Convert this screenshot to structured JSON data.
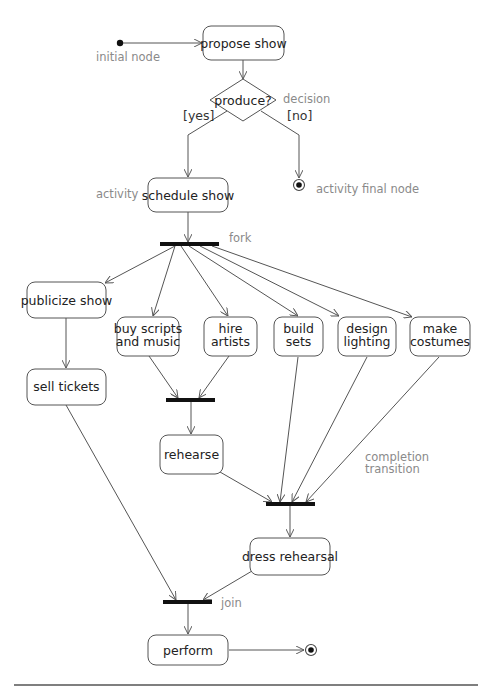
{
  "diagram": {
    "type": "UML activity diagram",
    "colors": {
      "node_stroke": "#555555",
      "bar": "#111111",
      "annotation": "#8a8a8a",
      "text": "#222222"
    },
    "nodes": {
      "propose_show": "propose show",
      "decision": "produce?",
      "schedule_show": "schedule show",
      "publicize_show": "publicize show",
      "buy_scripts": [
        "buy scripts",
        "and music"
      ],
      "hire_artists": [
        "hire",
        "artists"
      ],
      "build_sets": [
        "build",
        "sets"
      ],
      "design_lighting": [
        "design",
        "lighting"
      ],
      "make_costumes": [
        "make",
        "costumes"
      ],
      "sell_tickets": "sell tickets",
      "rehearse": "rehearse",
      "dress_rehearsal": "dress rehearsal",
      "perform": "perform"
    },
    "guards": {
      "yes": "[yes]",
      "no": "[no]"
    },
    "annotations": {
      "initial_node": "initial node",
      "decision": "decision",
      "activity": "activity",
      "activity_final_node": "activity final node",
      "fork": "fork",
      "completion_transition": [
        "completion",
        "transition"
      ],
      "join": "join"
    },
    "edges": [
      {
        "from": "initial",
        "to": "propose show"
      },
      {
        "from": "propose show",
        "to": "produce?"
      },
      {
        "from": "produce?",
        "to": "schedule show",
        "guard": "[yes]"
      },
      {
        "from": "produce?",
        "to": "activity final",
        "guard": "[no]"
      },
      {
        "from": "schedule show",
        "to": "fork"
      },
      {
        "from": "fork",
        "to": "publicize show"
      },
      {
        "from": "fork",
        "to": "buy scripts and music"
      },
      {
        "from": "fork",
        "to": "hire artists"
      },
      {
        "from": "fork",
        "to": "build sets"
      },
      {
        "from": "fork",
        "to": "design lighting"
      },
      {
        "from": "fork",
        "to": "make costumes"
      },
      {
        "from": "publicize show",
        "to": "sell tickets"
      },
      {
        "from": "buy scripts and music",
        "to": "join 1"
      },
      {
        "from": "hire artists",
        "to": "join 1"
      },
      {
        "from": "join 1",
        "to": "rehearse"
      },
      {
        "from": "rehearse",
        "to": "join 2"
      },
      {
        "from": "build sets",
        "to": "join 2"
      },
      {
        "from": "design lighting",
        "to": "join 2"
      },
      {
        "from": "make costumes",
        "to": "join 2"
      },
      {
        "from": "join 2",
        "to": "dress rehearsal"
      },
      {
        "from": "sell tickets",
        "to": "join 3"
      },
      {
        "from": "dress rehearsal",
        "to": "join 3"
      },
      {
        "from": "join 3",
        "to": "perform"
      },
      {
        "from": "perform",
        "to": "activity final"
      }
    ]
  }
}
